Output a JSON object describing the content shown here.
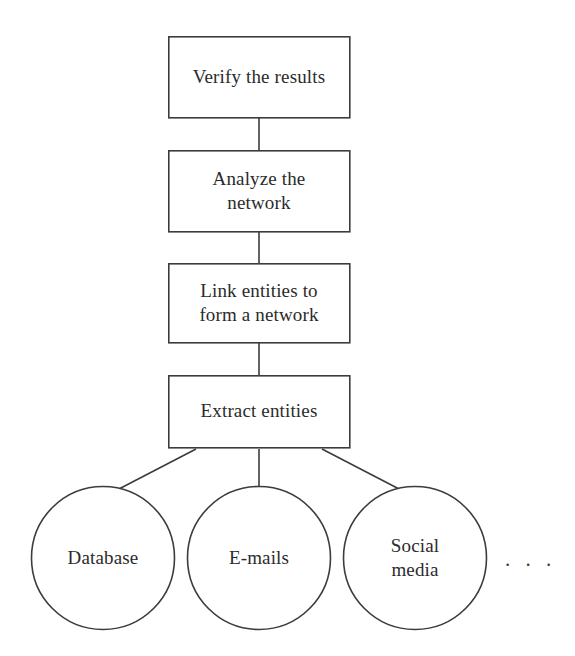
{
  "diagram": {
    "type": "flowchart",
    "orientation": "bottom-up",
    "stroke_color": "#3c3c3c",
    "text_color": "#2b2b2b",
    "background_color": "#ffffff",
    "process_nodes": [
      {
        "id": "verify-the-results",
        "label": "Verify the results",
        "shape": "rectangle",
        "x": 168,
        "y": 36,
        "width": 182,
        "height": 82
      },
      {
        "id": "analyze-the-network",
        "label": "Analyze the\nnetwork",
        "shape": "rectangle",
        "x": 168,
        "y": 150,
        "width": 182,
        "height": 82
      },
      {
        "id": "link-entities-to-form-a-network",
        "label": "Link entities to\nform a network",
        "shape": "rectangle",
        "x": 168,
        "y": 263,
        "width": 182,
        "height": 80
      },
      {
        "id": "extract-entities",
        "label": "Extract entities",
        "shape": "rectangle",
        "x": 168,
        "y": 375,
        "width": 182,
        "height": 73
      }
    ],
    "source_nodes": [
      {
        "id": "database",
        "label": "Database",
        "shape": "circle",
        "cx": 103,
        "cy": 558,
        "r": 72
      },
      {
        "id": "e-mails",
        "label": "E-mails",
        "shape": "circle",
        "cx": 259,
        "cy": 558,
        "r": 72
      },
      {
        "id": "social-media",
        "label": "Social\nmedia",
        "shape": "circle",
        "cx": 415,
        "cy": 558,
        "r": 72
      }
    ],
    "ellipsis": {
      "label": ". . .",
      "x": 505,
      "y": 549
    },
    "connectors": [
      {
        "id": "extract-to-link",
        "from": "extract-entities",
        "to": "link-entities-to-form-a-network",
        "x1": 259,
        "y1": 375,
        "x2": 259,
        "y2": 343
      },
      {
        "id": "link-to-analyze",
        "from": "link-entities-to-form-a-network",
        "to": "analyze-the-network",
        "x1": 259,
        "y1": 263,
        "x2": 259,
        "y2": 232
      },
      {
        "id": "analyze-to-verify",
        "from": "analyze-the-network",
        "to": "verify-the-results",
        "x1": 259,
        "y1": 150,
        "x2": 259,
        "y2": 118
      },
      {
        "id": "database-to-extract",
        "from": "database",
        "to": "extract-entities",
        "x1": 117,
        "y1": 490,
        "x2": 196,
        "y2": 448
      },
      {
        "id": "emails-to-extract",
        "from": "e-mails",
        "to": "extract-entities",
        "x1": 259,
        "y1": 486,
        "x2": 259,
        "y2": 448
      },
      {
        "id": "social-to-extract",
        "from": "social-media",
        "to": "extract-entities",
        "x1": 401,
        "y1": 490,
        "x2": 322,
        "y2": 448
      }
    ]
  }
}
